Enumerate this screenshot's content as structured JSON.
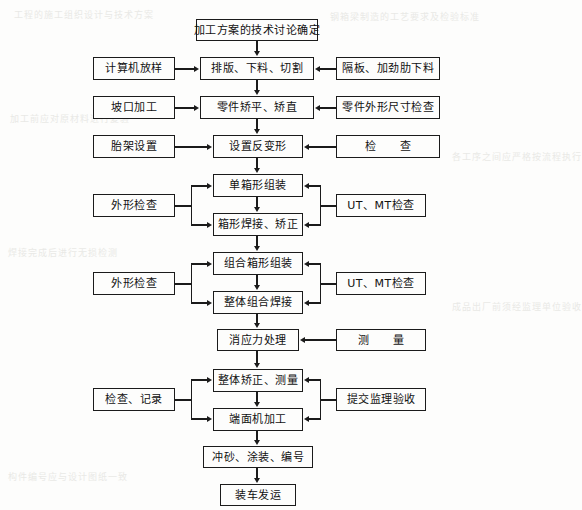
{
  "diagram": {
    "orientation": "top-to-bottom",
    "line_color": "#1b1b1b",
    "box_fill": "#fdfdfc",
    "page_background": "#fdfdfc"
  },
  "nodes": {
    "n01": {
      "label": "加工方案的技术讨论确定",
      "column": "center"
    },
    "n02": {
      "label": "排版、下料、切割",
      "column": "center"
    },
    "n03": {
      "label": "零件矫平、矫直",
      "column": "center"
    },
    "n04": {
      "label": "设置反变形",
      "column": "center"
    },
    "n05": {
      "label": "单箱形组装",
      "column": "center"
    },
    "n06": {
      "label": "箱形焊接、矫正",
      "column": "center"
    },
    "n07": {
      "label": "组合箱形组装",
      "column": "center"
    },
    "n08": {
      "label": "整体组合焊接",
      "column": "center"
    },
    "n09": {
      "label": "消应力处理",
      "column": "center"
    },
    "n10": {
      "label": "整体矫正、测量",
      "column": "center"
    },
    "n11": {
      "label": "端面机加工",
      "column": "center"
    },
    "n12": {
      "label": "冲砂、涂装、编号",
      "column": "center"
    },
    "n13": {
      "label": "装车发运",
      "column": "center"
    },
    "l01": {
      "label": "计算机放样",
      "column": "left"
    },
    "l02": {
      "label": "坡口加工",
      "column": "left"
    },
    "l03": {
      "label": "胎架设置",
      "column": "left"
    },
    "l04": {
      "label": "外形检查",
      "column": "left"
    },
    "l05": {
      "label": "外形检查",
      "column": "left"
    },
    "l06": {
      "label": "检查、记录",
      "column": "left"
    },
    "r01": {
      "label": "隔板、加劲肋下料",
      "column": "right"
    },
    "r02": {
      "label": "零件外形尺寸检查",
      "column": "right"
    },
    "r03": {
      "label": "检　　查",
      "column": "right"
    },
    "r04": {
      "label": "UT、MT检查",
      "column": "right"
    },
    "r05": {
      "label": "UT、MT检查",
      "column": "right"
    },
    "r06": {
      "label": "测　　量",
      "column": "right"
    },
    "r07": {
      "label": "提交监理验收",
      "column": "right"
    }
  },
  "ghost_text": {
    "g1": "工程的施工组织设计与技术方案",
    "g2": "钢箱梁制造的工艺要求及检验标准",
    "g3": "加工前应对原材料进行复验",
    "g4": "各工序之间应严格按流程执行",
    "g5": "焊接完成后进行无损检测",
    "g6": "成品出厂前须经监理单位验收",
    "g7": "构件编号应与设计图纸一致"
  }
}
